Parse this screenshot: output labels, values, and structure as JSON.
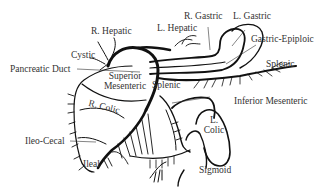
{
  "diagram": {
    "labels": {
      "r_hepatic": "R. Hepatic",
      "l_hepatic": "L. Hepatic",
      "r_gastric": "R. Gastric",
      "l_gastric": "L. Gastric",
      "gastric_epiploic": "Gastric-Epiploic",
      "cystic": "Cystic",
      "pancreatic_duct": "Pancreatic Duct",
      "superior_mesenteric_1": "Superior",
      "superior_mesenteric_2": "Mesenteric",
      "splenic_center": "Splenic",
      "splenic_right": "Splenic",
      "inferior_mesenteric": "Inferior Mesenteric",
      "r_colic": "R. Colic",
      "l_colic_1": "L.",
      "l_colic_2": "Colic",
      "ileo_cecal": "Ileo-Cecal",
      "ileal": "Ileal",
      "sigmoid": "Sigmoid"
    },
    "colors": {
      "line": "#111111",
      "text": "#333333",
      "background": "#ffffff"
    }
  }
}
